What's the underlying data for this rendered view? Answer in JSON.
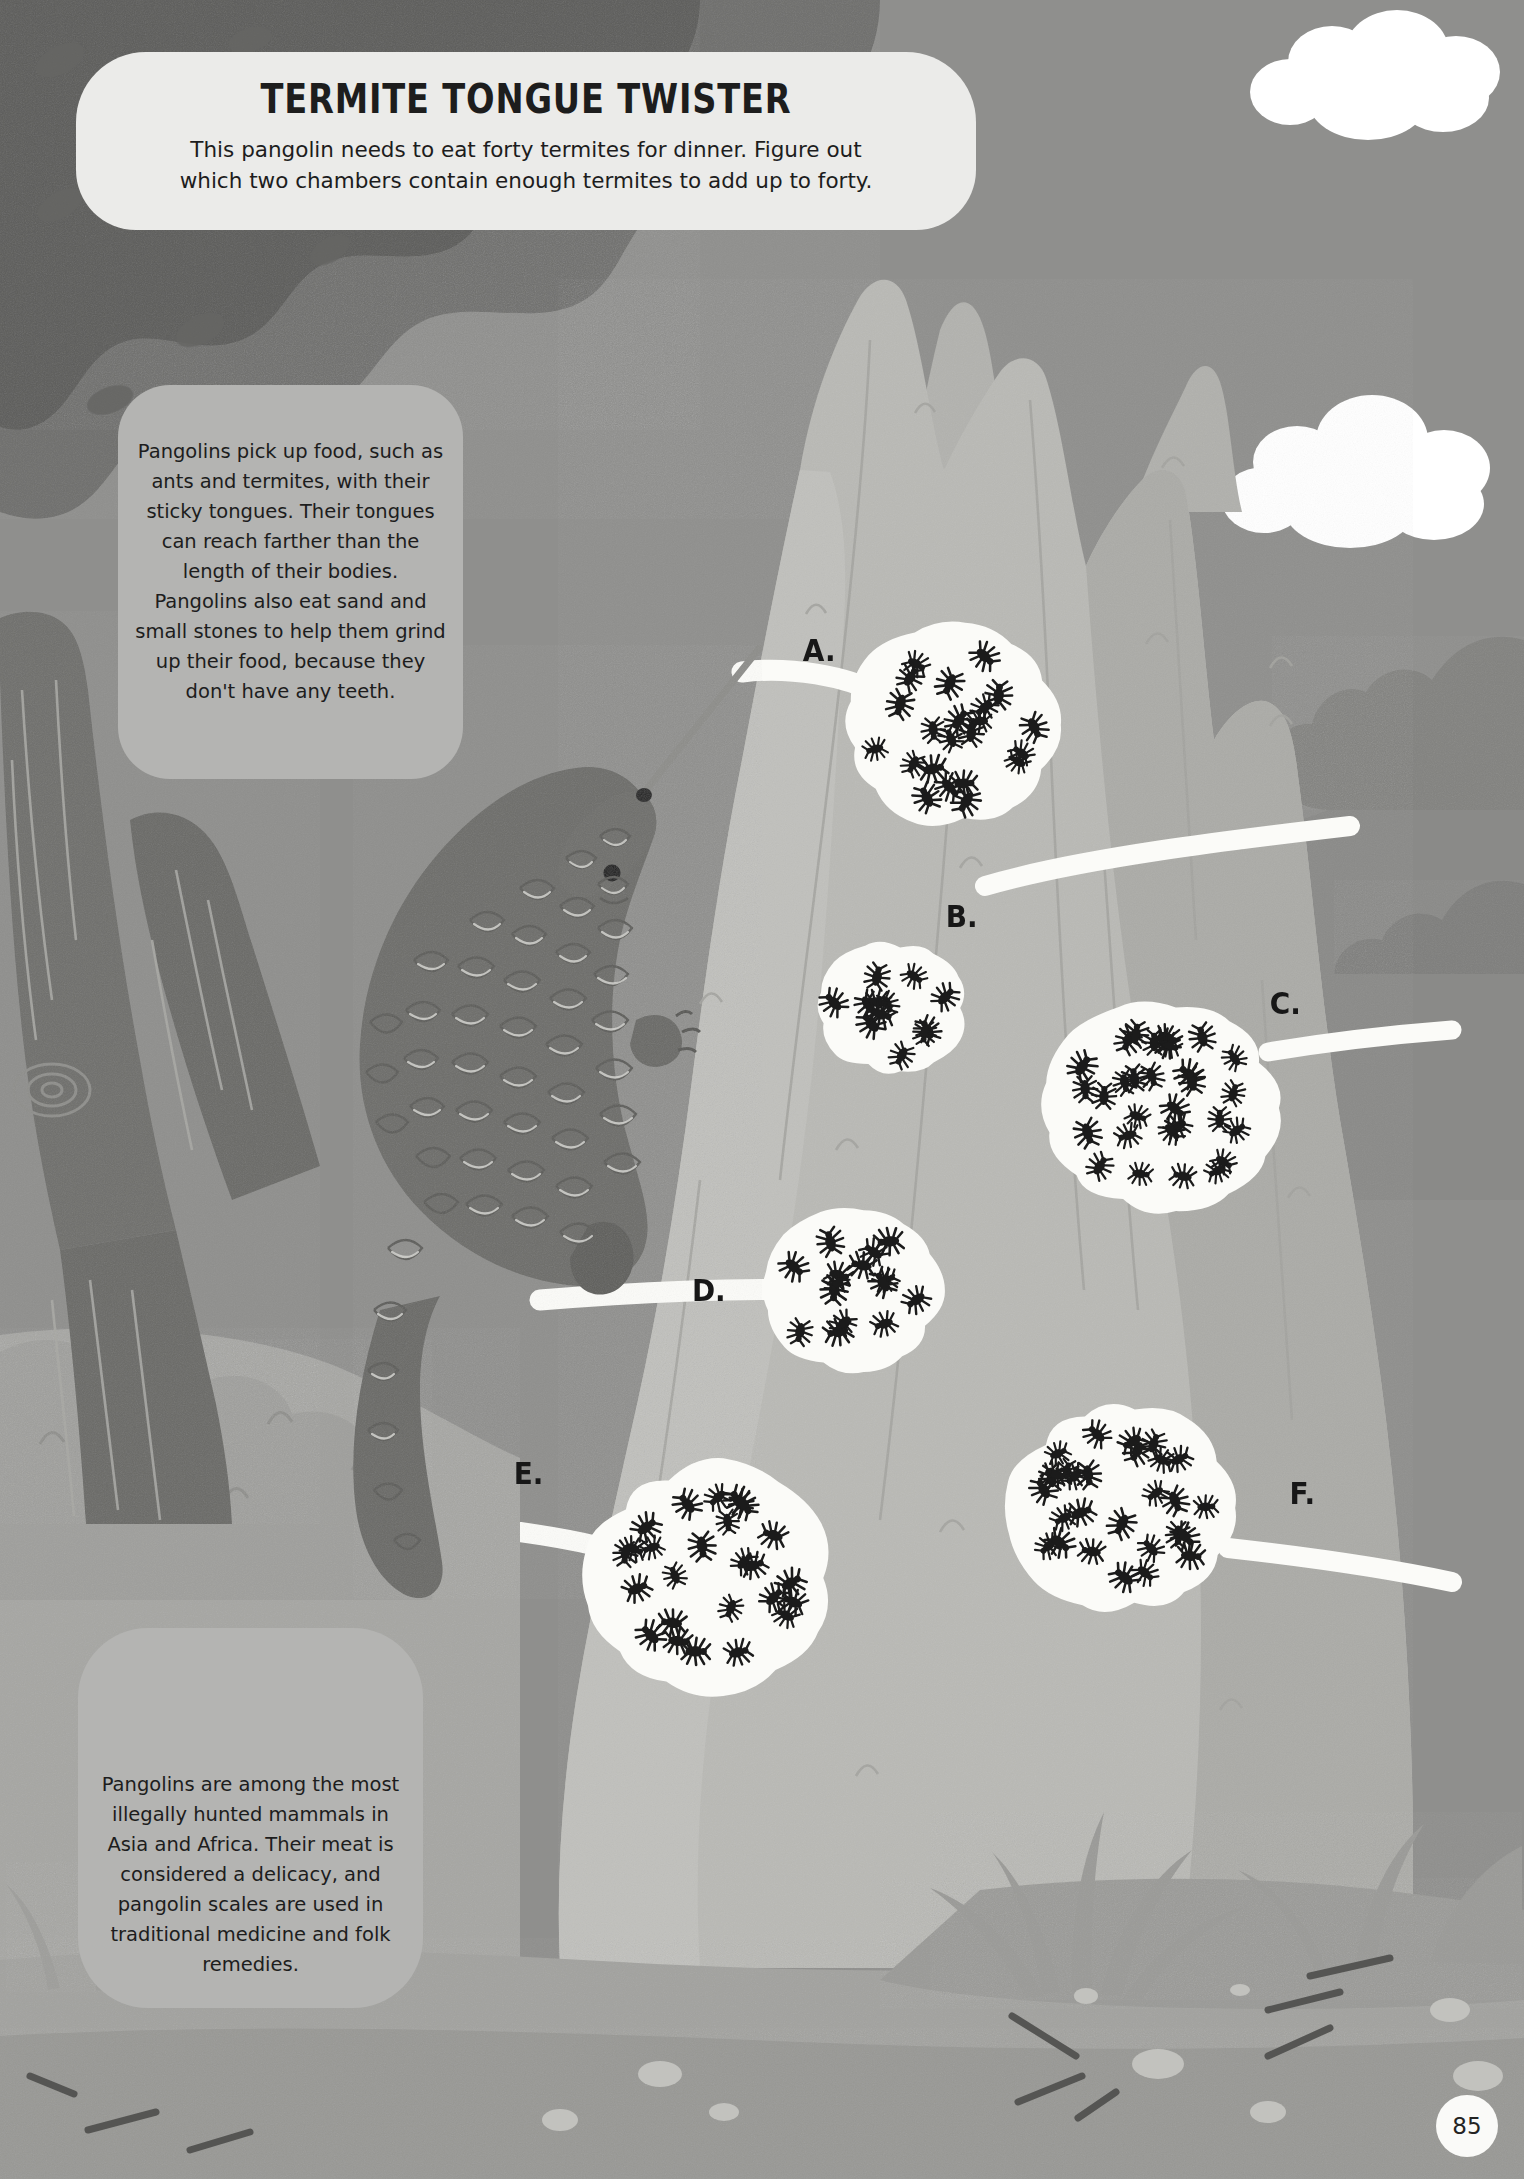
{
  "page": {
    "number": "85",
    "background_color": "#8a8a88",
    "sky_color": "#8f8f8d",
    "ground_color": "#adadaa",
    "mound_color": "#b9b9b5",
    "pangolin_color": "#6d6d6a",
    "chamber_color": "#fbfbf8",
    "bubble_color": "#b4b4b2",
    "title_bubble_color": "#ebebe9",
    "termite_color": "#1b1b1b"
  },
  "title_bubble": {
    "title": "TERMITE TONGUE TWISTER",
    "subtitle_line_1": "This pangolin needs to eat forty termites for dinner. Figure out",
    "subtitle_line_2": "which two chambers contain enough termites to add up to forty."
  },
  "info_bubble_1": {
    "text": "Pangolins pick up food, such as ants and termites, with their sticky tongues. Their tongues can reach farther than the length of their bodies. Pangolins also eat sand and small stones to help them grind up their food, because they don't have any teeth."
  },
  "info_bubble_2": {
    "text": "Pangolins are among the most illegally hunted mammals in Asia and Africa. Their meat is considered a delicacy, and pangolin scales are used in traditional medicine and folk remedies."
  },
  "chambers": [
    {
      "label": "A.",
      "termite_count": 22,
      "label_x": 801,
      "label_y": 632,
      "cx": 952,
      "cy": 725,
      "rx": 104,
      "ry": 98
    },
    {
      "label": "B.",
      "termite_count": 12,
      "label_x": 944,
      "label_y": 898,
      "cx": 892,
      "cy": 1008,
      "rx": 72,
      "ry": 65
    },
    {
      "label": "C.",
      "termite_count": 30,
      "label_x": 1268,
      "label_y": 985,
      "cx": 1162,
      "cy": 1108,
      "rx": 116,
      "ry": 103
    },
    {
      "label": "D.",
      "termite_count": 15,
      "label_x": 690,
      "label_y": 1272,
      "cx": 853,
      "cy": 1291,
      "rx": 86,
      "ry": 79
    },
    {
      "label": "E.",
      "termite_count": 25,
      "label_x": 512,
      "label_y": 1455,
      "cx": 708,
      "cy": 1578,
      "rx": 119,
      "ry": 112
    },
    {
      "label": "F.",
      "termite_count": 28,
      "label_x": 1288,
      "label_y": 1475,
      "cx": 1122,
      "cy": 1508,
      "rx": 110,
      "ry": 103
    }
  ],
  "chart_data": {
    "type": "bar",
    "categories": [
      "A.",
      "B.",
      "C.",
      "D.",
      "E.",
      "F."
    ],
    "values": [
      22,
      12,
      30,
      15,
      25,
      28
    ],
    "xlabel": "Chamber",
    "ylabel": "Termite count",
    "ylim": [
      0,
      32
    ],
    "target_total": 40,
    "solution_pair": [
      "C.",
      "B."
    ]
  },
  "scene": {
    "pangolin_name": "pangolin",
    "tree_name": "tree",
    "mound_name": "termite-mound",
    "clouds": 2
  }
}
